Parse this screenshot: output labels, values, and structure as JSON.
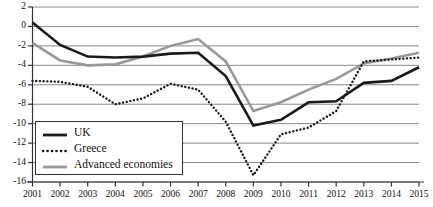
{
  "chart_data": {
    "type": "line",
    "title": "",
    "subtitle": "",
    "xlabel": "",
    "ylabel": "",
    "grid": "horizontal",
    "legend_position": "bottom-left",
    "x": [
      2001,
      2002,
      2003,
      2004,
      2005,
      2006,
      2007,
      2008,
      2009,
      2010,
      2011,
      2012,
      2013,
      2014,
      2015
    ],
    "xlim": [
      2001,
      2015
    ],
    "ylim": [
      -16,
      2
    ],
    "ytick_values": [
      2,
      0,
      -2,
      -4,
      -6,
      -8,
      -10,
      -12,
      -14,
      -16
    ],
    "ytick_labels": [
      "2",
      "0",
      "-2",
      "-4",
      "-6",
      "-8",
      "-10",
      "-12",
      "-14",
      "-16"
    ],
    "xtick_labels": [
      "2001",
      "2002",
      "2003",
      "2004",
      "2005",
      "2006",
      "2007",
      "2008",
      "2009",
      "2010",
      "2011",
      "2012",
      "2013",
      "2014",
      "2015"
    ],
    "series": [
      {
        "name": "UK",
        "style": "solid",
        "color": "#1a1a1a",
        "width": 2.6,
        "values": [
          0.4,
          -1.9,
          -3.1,
          -3.2,
          -3.1,
          -2.8,
          -2.7,
          -5.1,
          -10.2,
          -9.6,
          -7.8,
          -7.7,
          -5.8,
          -5.6,
          -4.2
        ]
      },
      {
        "name": "Greece",
        "style": "dotted",
        "color": "#1a1a1a",
        "width": 2.2,
        "values": [
          -5.6,
          -5.7,
          -6.2,
          -8.0,
          -7.4,
          -5.9,
          -6.5,
          -9.8,
          -15.3,
          -11.1,
          -10.4,
          -8.7,
          -3.6,
          -3.4,
          -3.2
        ]
      },
      {
        "name": "Advanced economies",
        "style": "solid",
        "color": "#999999",
        "width": 2.6,
        "values": [
          -1.7,
          -3.5,
          -4.0,
          -3.9,
          -3.1,
          -2.0,
          -1.3,
          -3.6,
          -8.7,
          -7.8,
          -6.5,
          -5.4,
          -3.8,
          -3.3,
          -2.7
        ]
      }
    ]
  },
  "legend": {
    "entries": [
      {
        "label": "UK",
        "icon": "solid-line-swatch"
      },
      {
        "label": "Greece",
        "icon": "dotted-line-swatch"
      },
      {
        "label": "Advanced economies",
        "icon": "gray-line-swatch"
      }
    ]
  }
}
